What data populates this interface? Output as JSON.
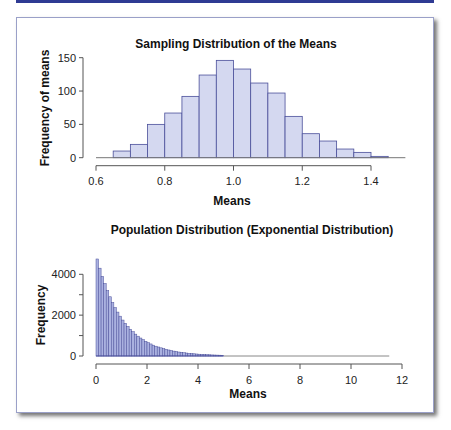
{
  "chart_data": [
    {
      "type": "bar",
      "title": "Sampling Distribution of the Means",
      "xlabel": "Means",
      "ylabel": "Frequency of means",
      "xlim": [
        0.6,
        1.5
      ],
      "ylim": [
        0,
        150
      ],
      "xticks": [
        "0.6",
        "0.8",
        "1.0",
        "1.2",
        "1.4"
      ],
      "yticks": [
        "0",
        "50",
        "100",
        "150"
      ],
      "bin_width": 0.05,
      "bin_starts": [
        0.6,
        0.65,
        0.7,
        0.75,
        0.8,
        0.85,
        0.9,
        0.95,
        1.0,
        1.05,
        1.1,
        1.15,
        1.2,
        1.25,
        1.3,
        1.35,
        1.4,
        1.45
      ],
      "values": [
        0,
        10,
        20,
        50,
        67,
        92,
        124,
        146,
        133,
        112,
        97,
        62,
        36,
        25,
        13,
        8,
        2,
        0
      ],
      "grid": false,
      "bar_color": "#d4d8f0",
      "edge_color": "#4a4f9a"
    },
    {
      "type": "bar",
      "title": "Population Distribution (Exponential Distribution)",
      "xlabel": "Means",
      "ylabel": "Frequency",
      "xlim": [
        0,
        12
      ],
      "ylim": [
        0,
        4800
      ],
      "xticks": [
        "0",
        "2",
        "4",
        "6",
        "8",
        "10",
        "12"
      ],
      "yticks": [
        "0",
        "2000",
        "4000"
      ],
      "bin_width": 0.1,
      "values_description": "exponential decay from ~4750 at 0 toward 0 by ~5, tail to ~11.5",
      "values": [
        4750,
        4300,
        3900,
        3550,
        3200,
        2900,
        2620,
        2370,
        2150,
        1950,
        1760,
        1600,
        1450,
        1310,
        1190,
        1070,
        970,
        880,
        800,
        720,
        650,
        590,
        530,
        480,
        440,
        400,
        360,
        325,
        295,
        265,
        240,
        220,
        195,
        180,
        160,
        145,
        130,
        120,
        108,
        98,
        88,
        80,
        72,
        65,
        59,
        53,
        48,
        44,
        40,
        36
      ],
      "grid": false,
      "bar_color": "#aab1e0",
      "edge_color": "#4a4f9a"
    }
  ]
}
